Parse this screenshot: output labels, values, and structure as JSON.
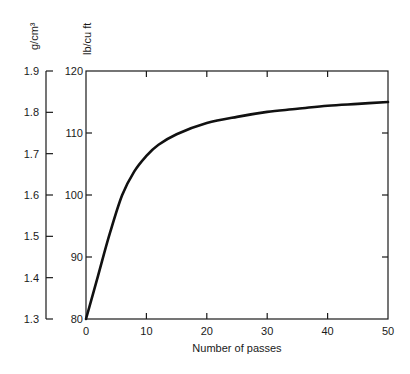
{
  "chart_data": {
    "type": "line",
    "title": "",
    "xlabel": "Number of passes",
    "ylabel": "lb/cu ft",
    "ylabel_secondary": "g/cm³",
    "xlim": [
      0,
      50
    ],
    "ylim": [
      80,
      120
    ],
    "ylim_secondary": [
      1.3,
      1.9
    ],
    "x_ticks": [
      "0",
      "10",
      "20",
      "30",
      "40",
      "50"
    ],
    "y_ticks": [
      "80",
      "90",
      "100",
      "110",
      "120"
    ],
    "y_ticks_secondary": [
      "1.3",
      "1.4",
      "1.5",
      "1.6",
      "1.7",
      "1.8",
      "1.9"
    ],
    "grid": false,
    "legend": null,
    "series": [
      {
        "name": "Density",
        "x": [
          0,
          2,
          4,
          6,
          8,
          10,
          12,
          15,
          20,
          25,
          30,
          35,
          40,
          45,
          50
        ],
        "values": [
          80,
          87,
          94,
          100,
          103.8,
          106.3,
          108.1,
          109.8,
          111.6,
          112.6,
          113.4,
          113.9,
          114.4,
          114.7,
          115
        ]
      }
    ]
  }
}
